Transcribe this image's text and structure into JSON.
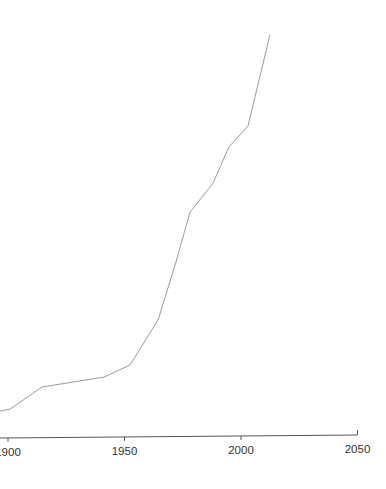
{
  "chart_data": {
    "type": "line",
    "title": "",
    "xlabel": "",
    "ylabel": "",
    "xlim": [
      1896.5,
      2050
    ],
    "ylim": [
      0,
      100
    ],
    "y_units": "relative (no y-axis shown)",
    "grid": false,
    "legend": "none",
    "x_ticks": [
      1900,
      1950,
      2000,
      2050
    ],
    "x_tick_labels": [
      "1900",
      "1950",
      "2000",
      "2050"
    ],
    "series": [
      {
        "name": "series-1",
        "color": "#9a9a9a",
        "x": [
          1896.6,
          1900.9,
          1914.6,
          1941.2,
          1952.4,
          1964.4,
          1972.1,
          1978.1,
          1988.0,
          1994.8,
          2003.0,
          2012.4
        ],
        "y": [
          0,
          0.5,
          6.3,
          8.9,
          12.1,
          23.9,
          39.1,
          52.2,
          59.8,
          69.3,
          74.8,
          98.7
        ]
      }
    ]
  }
}
